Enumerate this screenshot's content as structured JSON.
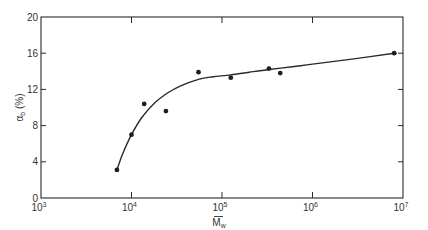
{
  "chart_data": {
    "type": "scatter",
    "title": "",
    "xlabel": "M̄w",
    "ylabel": "αb (%)",
    "xscale": "log",
    "xlim": [
      1000,
      10000000
    ],
    "ylim": [
      0,
      20
    ],
    "x_ticks": [
      {
        "value": 1000,
        "base": "10",
        "exp": "3"
      },
      {
        "value": 10000,
        "base": "10",
        "exp": "4"
      },
      {
        "value": 100000,
        "base": "10",
        "exp": "5"
      },
      {
        "value": 1000000,
        "base": "10",
        "exp": "6"
      },
      {
        "value": 10000000,
        "base": "10",
        "exp": "7"
      }
    ],
    "y_ticks": [
      0,
      4,
      8,
      12,
      16,
      20
    ],
    "grid": false,
    "legend": null,
    "series": [
      {
        "name": "data points",
        "marker": "filled-circle",
        "x": [
          6900,
          10000,
          13800,
          24000,
          55000,
          125000,
          330000,
          440000,
          8000000
        ],
        "y": [
          3.1,
          7.0,
          10.4,
          9.6,
          13.9,
          13.3,
          14.3,
          13.8,
          16.0
        ]
      },
      {
        "name": "fitted curve",
        "marker": "line",
        "x": [
          6900,
          8000,
          10000,
          13000,
          18000,
          25000,
          35000,
          55000,
          80000,
          125000,
          200000,
          330000,
          600000,
          1000000,
          3000000,
          8000000
        ],
        "y": [
          3.1,
          4.9,
          7.0,
          8.9,
          10.5,
          11.6,
          12.4,
          13.1,
          13.4,
          13.6,
          13.9,
          14.2,
          14.5,
          14.8,
          15.4,
          16.0
        ]
      }
    ]
  },
  "axes": {
    "x_label_main": "M",
    "x_label_sub": "w",
    "y_label_main": "α",
    "y_label_sub": "b",
    "y_label_unit": "(%)"
  }
}
